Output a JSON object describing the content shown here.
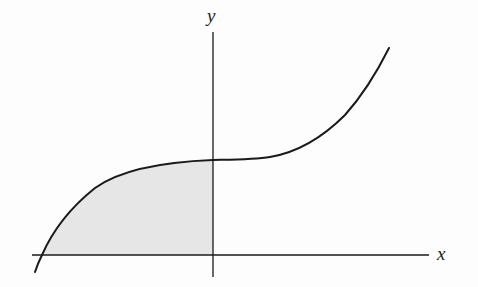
{
  "figure": {
    "type": "function-graph",
    "axes": {
      "x_label": "x",
      "y_label": "y"
    },
    "curve": {
      "shape": "cubic (inflection near y-axis, increasing)",
      "points_px": [
        [
          35,
          272
        ],
        [
          42,
          255
        ],
        [
          50,
          240
        ],
        [
          60,
          222
        ],
        [
          75,
          203
        ],
        [
          90,
          190
        ],
        [
          108,
          180
        ],
        [
          140,
          168
        ],
        [
          170,
          162
        ],
        [
          213,
          160
        ],
        [
          240,
          159
        ],
        [
          265,
          158
        ],
        [
          300,
          148
        ],
        [
          320,
          138
        ],
        [
          340,
          120
        ],
        [
          360,
          95
        ],
        [
          378,
          70
        ],
        [
          389,
          48
        ]
      ]
    },
    "shaded_region": {
      "from": "x-intercept of curve",
      "to": "y-axis (x = 0)",
      "between": "curve and x-axis",
      "color": "#e6e6e6"
    },
    "colors": {
      "background": "#fdfdfd",
      "stroke": "#1a1a1a",
      "shade": "#e6e6e6"
    }
  }
}
